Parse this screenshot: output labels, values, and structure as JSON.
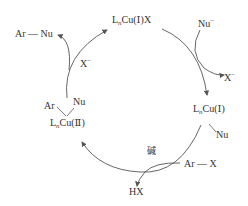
{
  "species": {
    "top": {
      "pre": "L",
      "sub": "n",
      "post": "Cu(Ⅰ)X"
    },
    "right": {
      "pre": "L",
      "sub": "n",
      "post": "Cu(Ⅰ)",
      "ligand": "Nu"
    },
    "left": {
      "pre": "L",
      "sub": "n",
      "post": "Cu(Ⅱ)",
      "ligand_ar": "Ar",
      "ligand_nu": "Nu"
    }
  },
  "reagents": {
    "nu_in": {
      "text": "Nu",
      "sup": "−"
    },
    "x_out_right": {
      "text": "X",
      "sup": "−"
    },
    "ar_x": "Ar — X",
    "base": "碱",
    "hx": "HX",
    "x_in_left": {
      "text": "X",
      "sup": "−"
    },
    "product": "Ar — Nu"
  }
}
